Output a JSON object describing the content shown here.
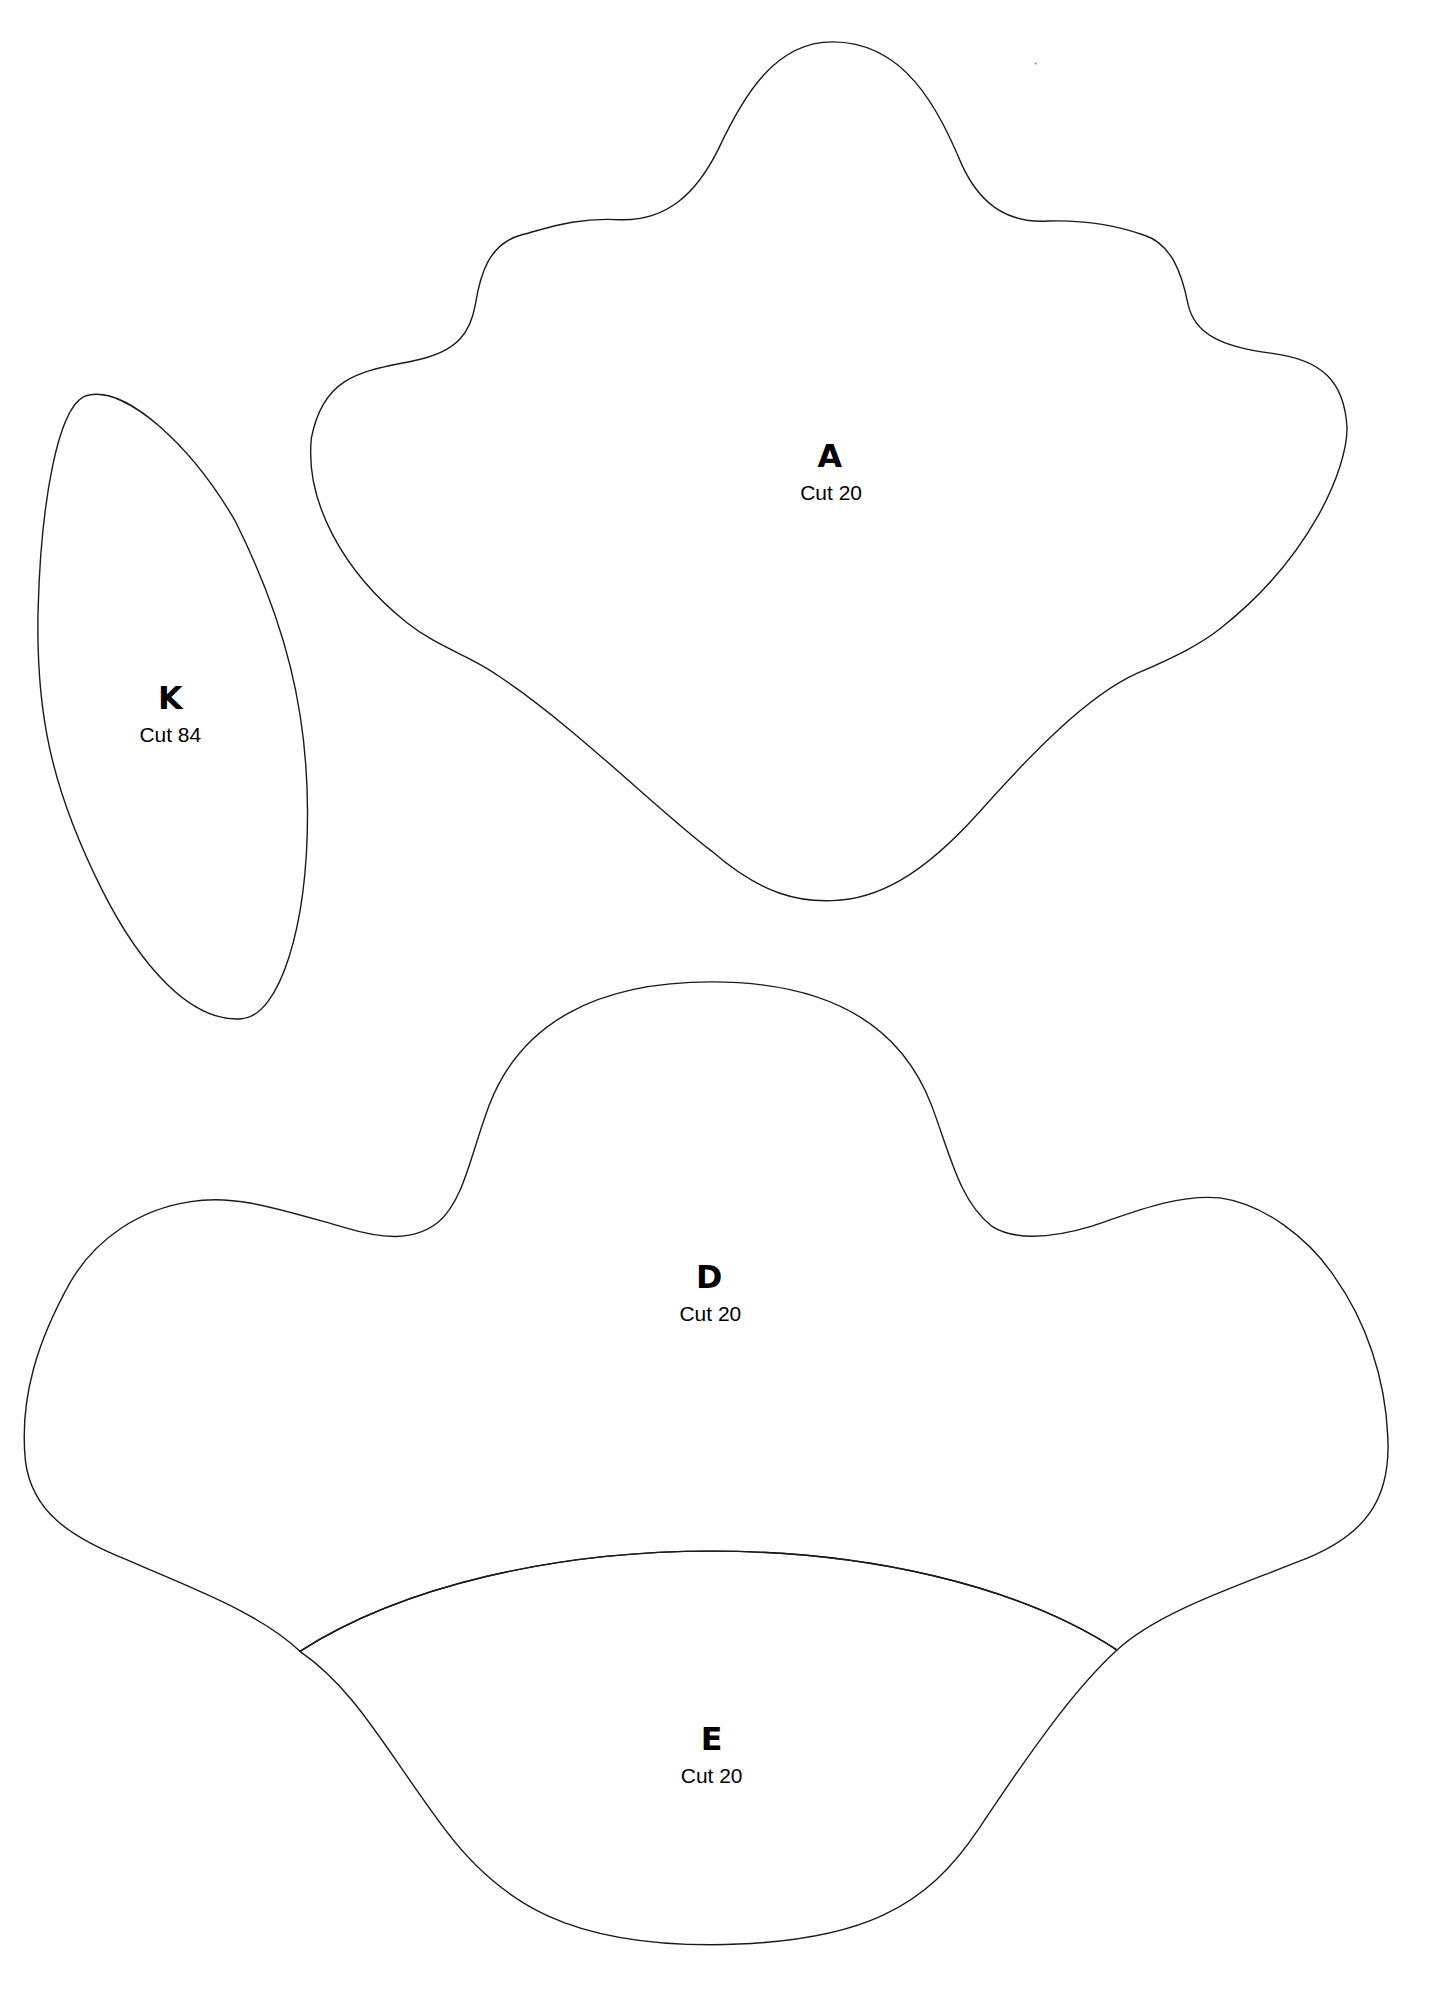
{
  "document": {
    "type": "sewing pattern template sheet",
    "background": "#ffffff",
    "line_color": "#1a1a1a"
  },
  "pieces": [
    {
      "id": "A",
      "letter": "A",
      "cut": "Cut 20"
    },
    {
      "id": "K",
      "letter": "K",
      "cut": "Cut 84"
    },
    {
      "id": "D",
      "letter": "D",
      "cut": "Cut 20"
    },
    {
      "id": "E",
      "letter": "E",
      "cut": "Cut 20"
    }
  ]
}
